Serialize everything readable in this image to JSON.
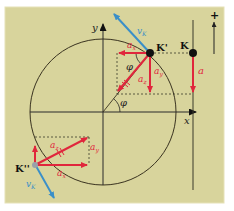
{
  "diagram": {
    "colors": {
      "background": "#d8d49c",
      "frame_border": "#e6e2b8",
      "axis": "#2b2b2b",
      "circle": "#3a3320",
      "acceleration": "#e0263c",
      "velocity": "#3a8fc8",
      "dashed": "#3a3a2a",
      "point": "#111111"
    },
    "axes": {
      "x_label": "x",
      "y_label": "y"
    },
    "angle_label": "φ",
    "points": {
      "k_prime": "K'",
      "k": "K",
      "k_double_prime": "K''"
    },
    "vectors": {
      "v_k_top": "v",
      "v_k_top_sub": "K",
      "v_k_bottom": "v",
      "v_k_bottom_sub": "K",
      "a_x_top": "a",
      "a_x_top_sub": "x",
      "a_z_top": "a",
      "a_z_top_sub": "z",
      "a_y_top": "a",
      "a_y_top_sub": "y",
      "a_right": "a",
      "a_z_bottom": "a",
      "a_z_bottom_sub": "z",
      "a_y_bottom": "a",
      "a_y_bottom_sub": "y",
      "a_x_bottom": "a",
      "a_x_bottom_sub": "x"
    },
    "direction_indicator": "+"
  }
}
